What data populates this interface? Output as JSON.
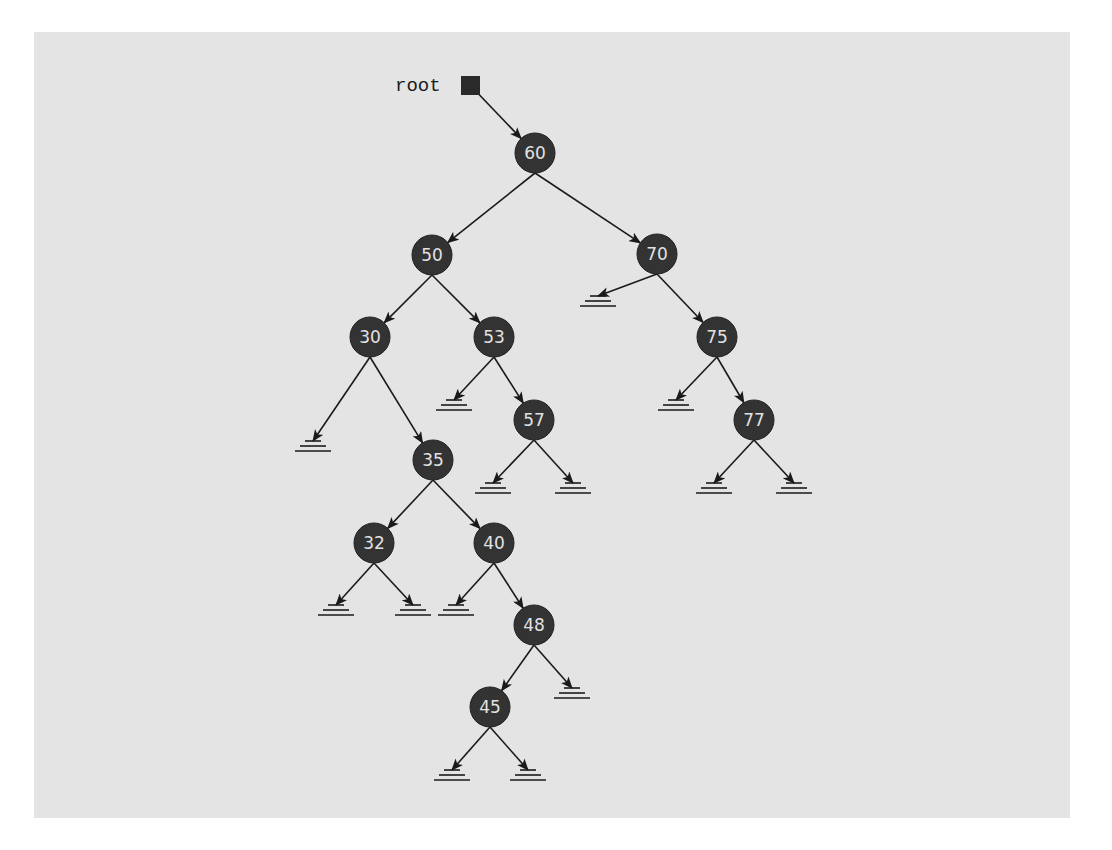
{
  "diagram": {
    "type": "binary-search-tree",
    "colors": {
      "background": "#e4e4e4",
      "node_fill": "#333333",
      "node_text": "#e2e2e2",
      "edge": "#1a1a1a"
    },
    "root_pointer": {
      "label": "root",
      "x": 470,
      "y": 85,
      "points_to": "60"
    },
    "node_radius": 20,
    "nodes": [
      {
        "id": "60",
        "label": "60",
        "x": 535,
        "y": 153
      },
      {
        "id": "50",
        "label": "50",
        "x": 432,
        "y": 255
      },
      {
        "id": "70",
        "label": "70",
        "x": 657,
        "y": 254
      },
      {
        "id": "30",
        "label": "30",
        "x": 370,
        "y": 337
      },
      {
        "id": "53",
        "label": "53",
        "x": 494,
        "y": 337
      },
      {
        "id": "75",
        "label": "75",
        "x": 717,
        "y": 337
      },
      {
        "id": "35",
        "label": "35",
        "x": 433,
        "y": 460
      },
      {
        "id": "57",
        "label": "57",
        "x": 534,
        "y": 420
      },
      {
        "id": "77",
        "label": "77",
        "x": 754,
        "y": 420
      },
      {
        "id": "32",
        "label": "32",
        "x": 374,
        "y": 543
      },
      {
        "id": "40",
        "label": "40",
        "x": 494,
        "y": 543
      },
      {
        "id": "48",
        "label": "48",
        "x": 534,
        "y": 625
      },
      {
        "id": "45",
        "label": "45",
        "x": 490,
        "y": 707
      }
    ],
    "edges": [
      {
        "from": "60",
        "to": "50"
      },
      {
        "from": "60",
        "to": "70"
      },
      {
        "from": "50",
        "to": "30"
      },
      {
        "from": "50",
        "to": "53"
      },
      {
        "from": "70",
        "to": "null",
        "nx": 598,
        "ny": 296
      },
      {
        "from": "70",
        "to": "75"
      },
      {
        "from": "30",
        "to": "null",
        "nx": 313,
        "ny": 441
      },
      {
        "from": "30",
        "to": "35"
      },
      {
        "from": "53",
        "to": "null",
        "nx": 454,
        "ny": 400
      },
      {
        "from": "53",
        "to": "57"
      },
      {
        "from": "75",
        "to": "null",
        "nx": 676,
        "ny": 400
      },
      {
        "from": "75",
        "to": "77"
      },
      {
        "from": "57",
        "to": "null",
        "nx": 493,
        "ny": 483
      },
      {
        "from": "57",
        "to": "null",
        "nx": 573,
        "ny": 483
      },
      {
        "from": "77",
        "to": "null",
        "nx": 714,
        "ny": 483
      },
      {
        "from": "77",
        "to": "null",
        "nx": 794,
        "ny": 483
      },
      {
        "from": "35",
        "to": "32"
      },
      {
        "from": "35",
        "to": "40"
      },
      {
        "from": "32",
        "to": "null",
        "nx": 336,
        "ny": 605
      },
      {
        "from": "32",
        "to": "null",
        "nx": 413,
        "ny": 605
      },
      {
        "from": "40",
        "to": "null",
        "nx": 456,
        "ny": 605
      },
      {
        "from": "40",
        "to": "48"
      },
      {
        "from": "48",
        "to": "45"
      },
      {
        "from": "48",
        "to": "null",
        "nx": 572,
        "ny": 688
      },
      {
        "from": "45",
        "to": "null",
        "nx": 452,
        "ny": 770
      },
      {
        "from": "45",
        "to": "null",
        "nx": 528,
        "ny": 770
      }
    ]
  }
}
